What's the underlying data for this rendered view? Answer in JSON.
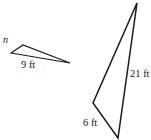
{
  "figure": {
    "background_color": "#ffffff",
    "stroke_color": "#1a1a1a",
    "units": "ft",
    "labels": {
      "unknown_side": "n",
      "left_triangle_base": "9 ft",
      "right_triangle_base": "6 ft",
      "right_triangle_side": "21 ft"
    },
    "shapes": [
      {
        "name": "left-triangle",
        "points": "11,53 23,45 70,63",
        "labeled_sides": [
          {
            "label": "n",
            "position": "upper-left"
          },
          {
            "label": "9 ft",
            "position": "bottom"
          }
        ]
      },
      {
        "name": "right-triangle",
        "points": "137,3 93,103 118,138",
        "labeled_sides": [
          {
            "label": "6 ft",
            "position": "bottom-left"
          },
          {
            "label": "21 ft",
            "position": "right"
          }
        ]
      }
    ]
  }
}
